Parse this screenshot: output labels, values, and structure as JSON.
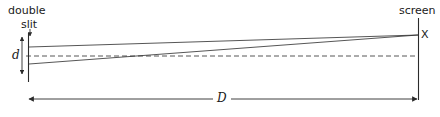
{
  "figure": {
    "type": "optics-ray-diagram",
    "width": 440,
    "height": 117,
    "background_color": "#ffffff",
    "stroke_color": "#2b2b2b",
    "text_color": "#1a1a1a"
  },
  "labels": {
    "double": "double",
    "slit": "slit",
    "screen": "screen",
    "point_x": "X",
    "slit_separation": "d",
    "slit_to_screen_distance": "D"
  },
  "geometry": {
    "slit_barrier_x": 28,
    "slit_barrier_top_y": 33,
    "slit_barrier_bottom_y": 82,
    "screen_x": 418,
    "screen_top_y": 18,
    "screen_bottom_y": 100,
    "upper_slit_y": 47,
    "lower_slit_y": 64,
    "axis_y": 56,
    "convergence_point": {
      "x": 418,
      "y": 35
    },
    "d_arrow": {
      "x": 22,
      "y_top": 36,
      "y_bottom": 75
    },
    "D_arrow": {
      "y": 99,
      "x_left": 29,
      "x_right": 417
    },
    "pointer_to_slit": {
      "x": 30,
      "y_top": 31,
      "y_bottom": 34
    }
  }
}
